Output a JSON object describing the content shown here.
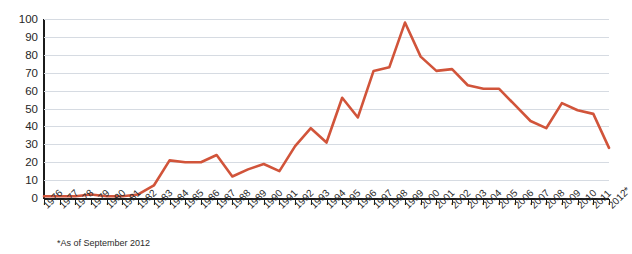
{
  "chart_data": {
    "type": "line",
    "title": "",
    "xlabel": "",
    "ylabel": "",
    "ylim": [
      0,
      100
    ],
    "yticks": [
      0,
      10,
      20,
      30,
      40,
      50,
      60,
      70,
      80,
      90,
      100
    ],
    "grid": true,
    "legend": "none",
    "line_color": "#d1543a",
    "categories": [
      "1976",
      "1977",
      "1978",
      "1979",
      "1980",
      "1981",
      "1982",
      "1983",
      "1984",
      "1985",
      "1986",
      "1987",
      "1988",
      "1989",
      "1990",
      "1991",
      "1992",
      "1993",
      "1994",
      "1995",
      "1996",
      "1997",
      "1998",
      "1999",
      "2000",
      "2001",
      "2002",
      "2003",
      "2004",
      "2005",
      "2006",
      "2007",
      "2008",
      "2009",
      "2010",
      "2011",
      "2012*"
    ],
    "values": [
      1,
      1,
      1,
      2,
      1,
      1,
      2,
      7,
      21,
      20,
      20,
      24,
      12,
      16,
      19,
      15,
      29,
      39,
      31,
      56,
      45,
      71,
      73,
      98,
      79,
      71,
      72,
      63,
      61,
      61,
      52,
      43,
      39,
      53,
      49,
      47,
      28
    ],
    "annotations": [
      "*As of September 2012"
    ]
  },
  "axis": {
    "y_tick_labels": [
      "0",
      "10",
      "20",
      "30",
      "40",
      "50",
      "60",
      "70",
      "80",
      "90",
      "100"
    ],
    "x_tick_labels": [
      "1976",
      "1977",
      "1978",
      "1979",
      "1980",
      "1981",
      "1982",
      "1983",
      "1984",
      "1985",
      "1986",
      "1987",
      "1988",
      "1989",
      "1990",
      "1991",
      "1992",
      "1993",
      "1994",
      "1995",
      "1996",
      "1997",
      "1998",
      "1999",
      "2000",
      "2001",
      "2002",
      "2003",
      "2004",
      "2005",
      "2006",
      "2007",
      "2008",
      "2009",
      "2010",
      "2011",
      "2012*"
    ]
  },
  "footnote": "*As of September 2012",
  "title_cropped": ""
}
